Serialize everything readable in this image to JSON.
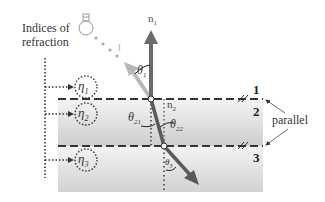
{
  "diagram": {
    "title_line1": "Indices of",
    "title_line2": "refraction",
    "indices": [
      {
        "symbol": "η",
        "sub": "1"
      },
      {
        "symbol": "η",
        "sub": "2"
      },
      {
        "symbol": "η",
        "sub": "3"
      }
    ],
    "normal_label": {
      "symbol": "n",
      "sub": "1"
    },
    "normal2_label": {
      "symbol": "n",
      "sub": "2"
    },
    "incident_ray_label": "l",
    "angles": [
      {
        "symbol": "θ",
        "sub": "1"
      },
      {
        "symbol": "θ",
        "sub": "21"
      },
      {
        "symbol": "θ",
        "sub": "22"
      },
      {
        "symbol": "θ",
        "sub": "3"
      }
    ],
    "interface_labels": [
      "1",
      "2",
      "3"
    ],
    "parallel_label": "parallel",
    "light_source": "light-bulb",
    "colors": {
      "normal_arrow": "#6a6a6a",
      "incident_ray": "#b8b8b8",
      "refracted_ray": "#5a5a5a",
      "slab_light": "#f2f2f2",
      "slab_dark": "#cfcfcf",
      "dashed_line": "#333333"
    }
  }
}
